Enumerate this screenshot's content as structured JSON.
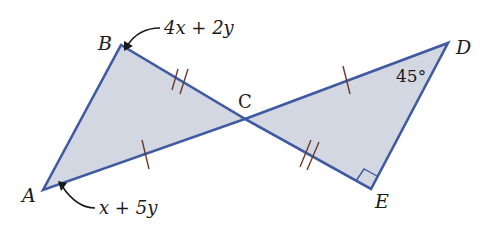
{
  "diagram": {
    "type": "geometry",
    "colors": {
      "fill": "#d3d7e2",
      "stroke": "#3f5aa0",
      "tick": "#6b3a2a",
      "arrow": "#1a1a1a",
      "text": "#1a1a1a"
    },
    "vertices": {
      "A": {
        "label": "A",
        "x": 43,
        "y": 190
      },
      "B": {
        "label": "B",
        "x": 121,
        "y": 45
      },
      "C": {
        "label": "C",
        "x": 245,
        "y": 119
      },
      "D": {
        "label": "D",
        "x": 448,
        "y": 43
      },
      "E": {
        "label": "E",
        "x": 371,
        "y": 189
      }
    },
    "angle_labels": {
      "B": "4x + 2y",
      "A": "x + 5y",
      "D": "45°"
    },
    "marks": {
      "right_angle_at": "E",
      "single_tick_segments": [
        "AC",
        "CD"
      ],
      "double_tick_segments": [
        "BC",
        "CE"
      ]
    }
  }
}
